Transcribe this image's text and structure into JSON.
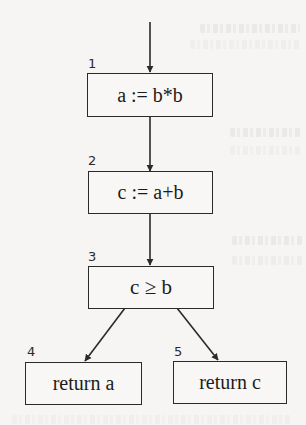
{
  "diagram": {
    "type": "control-flow-graph",
    "nodes": [
      {
        "id": "1",
        "label": "1",
        "text": "a := b*b"
      },
      {
        "id": "2",
        "label": "2",
        "text": "c := a+b"
      },
      {
        "id": "3",
        "label": "3",
        "text": "c ≥ b"
      },
      {
        "id": "4",
        "label": "4",
        "text": "return a"
      },
      {
        "id": "5",
        "label": "5",
        "text": "return c"
      }
    ],
    "edges": [
      {
        "from": "entry",
        "to": "1"
      },
      {
        "from": "1",
        "to": "2"
      },
      {
        "from": "2",
        "to": "3"
      },
      {
        "from": "3",
        "to": "4"
      },
      {
        "from": "3",
        "to": "5"
      }
    ],
    "colors": {
      "stroke": "#2a2a2a",
      "background": "#f6f5f3"
    }
  }
}
